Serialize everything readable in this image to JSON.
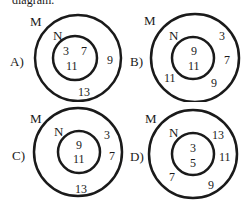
{
  "top_text": "diagram.",
  "options": [
    {
      "letter": "A)",
      "outer_set": "M",
      "inner_set": "N",
      "inner_numbers": [
        "3",
        "7",
        "11"
      ],
      "outer_numbers": [
        "9",
        "13"
      ]
    },
    {
      "letter": "B)",
      "outer_set": "M",
      "inner_set": "N",
      "inner_numbers": [
        "9",
        "11"
      ],
      "outer_numbers": [
        "3",
        "7",
        "11",
        "9"
      ]
    },
    {
      "letter": "C)",
      "outer_set": "M",
      "inner_set": "N",
      "inner_numbers": [
        "9",
        "11"
      ],
      "outer_numbers": [
        "3",
        "7",
        "13"
      ]
    },
    {
      "letter": "D)",
      "outer_set": "M",
      "inner_set": "N",
      "inner_numbers": [
        "3",
        "5"
      ],
      "outer_numbers": [
        "13",
        "11",
        "7",
        "9"
      ]
    }
  ],
  "colors": {
    "stroke": "#1a1a1a",
    "background": "#ffffff"
  }
}
